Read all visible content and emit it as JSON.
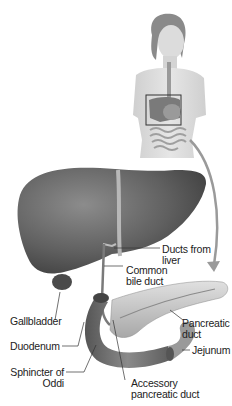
{
  "diagram": {
    "title": "",
    "style": "grayscale anatomical illustration",
    "inset": {
      "figure": "female torso with digestive organs",
      "highlight_box": "liver and pancreas region"
    },
    "labels": {
      "ducts_from_liver": {
        "line1": "Ducts from",
        "line2": "liver"
      },
      "common_bile_duct": {
        "line1": "Common",
        "line2": "bile duct"
      },
      "gallbladder": {
        "line1": "Gallbladder"
      },
      "pancreatic_duct": {
        "line1": "Pancreatic",
        "line2": "duct"
      },
      "duodenum": {
        "line1": "Duodenum"
      },
      "jejunum": {
        "line1": "Jejunum"
      },
      "sphincter_of_oddi": {
        "line1": "Sphincter of",
        "line2": "Oddi"
      },
      "accessory_pancreatic_duct": {
        "line1": "Accessory",
        "line2": "pancreatic duct"
      }
    },
    "colors": {
      "organ_dark": "#5a5a5a",
      "organ_mid": "#8a8a8a",
      "organ_light": "#c8c8c8",
      "skin": "#d9d9d9",
      "arrow": "#9a9a9a",
      "text": "#222222"
    }
  }
}
